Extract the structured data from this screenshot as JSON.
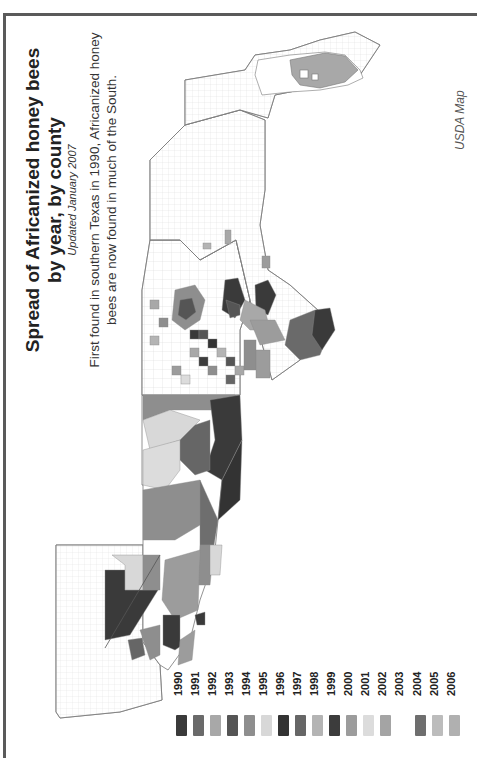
{
  "title": {
    "line1": "Spread of Africanized honey bees",
    "line2": "by year, by county",
    "updated": "Updated January 2007"
  },
  "subtitle": "First found in southern Texas in 1990, Africanized honey bees are now found in much of the South.",
  "credit": "USDA Map",
  "colors": {
    "frame": "#5a5a5a",
    "background": "#ffffff",
    "county_outline": "#9a9a9a",
    "unaffected": "#ffffff"
  },
  "legend": {
    "items": [
      {
        "year": "1990",
        "color": "#3a3a3a"
      },
      {
        "year": "1991",
        "color": "#6a6a6a"
      },
      {
        "year": "1992",
        "color": "#a8a8a8"
      },
      {
        "year": "1993",
        "color": "#555555"
      },
      {
        "year": "1994",
        "color": "#8e8e8e"
      },
      {
        "year": "1995",
        "color": "#d8d8d8"
      },
      {
        "year": "1996",
        "color": "#333333"
      },
      {
        "year": "1997",
        "color": "#666666"
      },
      {
        "year": "1998",
        "color": "#b4b4b4"
      },
      {
        "year": "1999",
        "color": "#3c3c3c"
      },
      {
        "year": "2000",
        "color": "#9c9c9c"
      },
      {
        "year": "2001",
        "color": "#dcdcdc"
      },
      {
        "year": "2002",
        "color": "#a4a4a4"
      },
      {
        "year": "2003",
        "color": "#ffffff"
      },
      {
        "year": "2004",
        "color": "#6e6e6e"
      },
      {
        "year": "2005",
        "color": "#bcbcbc"
      },
      {
        "year": "2006",
        "color": "#b0b0b0"
      }
    ]
  },
  "map": {
    "orientation": "rotated 90 degrees counter-clockwise (north points left)",
    "regions_shown": [
      "California",
      "Nevada",
      "Arizona",
      "New Mexico",
      "Texas",
      "Oklahoma",
      "Arkansas",
      "Louisiana",
      "Missouri",
      "Kansas",
      "Mississippi",
      "Alabama",
      "Georgia",
      "Florida",
      "Tennessee",
      "Kentucky",
      "Virginia",
      "North Carolina",
      "South Carolina",
      "Maryland"
    ]
  }
}
